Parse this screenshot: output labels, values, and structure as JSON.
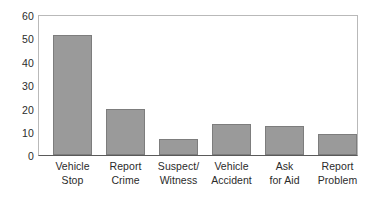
{
  "chart_data": {
    "type": "bar",
    "title": "",
    "subtitle": "",
    "xlabel": "",
    "ylabel": "",
    "categories": [
      "Vehicle Stop",
      "Report Crime",
      "Suspect/ Witness",
      "Vehicle Accident",
      "Ask for Aid",
      "Report Problem"
    ],
    "category_lines": [
      [
        "Vehicle",
        "Stop"
      ],
      [
        "Report",
        "Crime"
      ],
      [
        "Suspect/",
        "Witness"
      ],
      [
        "Vehicle",
        "Accident"
      ],
      [
        "Ask",
        "for Aid"
      ],
      [
        "Report",
        "Problem"
      ]
    ],
    "values": [
      52,
      20,
      7,
      13.5,
      12.5,
      9
    ],
    "ylim": [
      0,
      60
    ],
    "yticks": [
      0,
      10,
      20,
      30,
      40,
      50,
      60
    ],
    "ytick_labels": [
      "0",
      "10",
      "20",
      "30",
      "40",
      "50",
      "60"
    ],
    "grid": false,
    "legend": "none",
    "bar_color": "#9a9a9a",
    "bar_edge_color": "#7d7d7d",
    "axis_color": "#5a5a5a",
    "frame_color": "#b9b9b9",
    "text_color": "#2b2b2b",
    "background_color": "#ffffff"
  }
}
